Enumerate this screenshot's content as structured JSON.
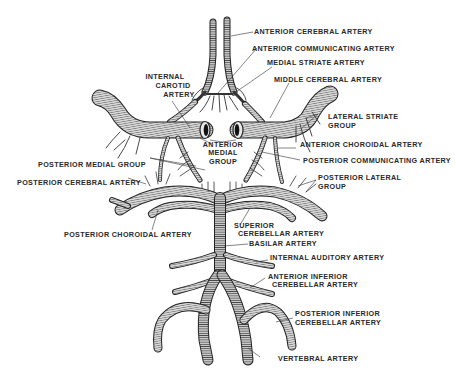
{
  "diagram": {
    "type": "anatomical-illustration",
    "colors": {
      "vessel_fill": "#d6d6d6",
      "vessel_hatch": "#4a4a4a",
      "vessel_edge": "#222222",
      "label": "#2a2a2a",
      "leader": "#333333",
      "background": "#ffffff"
    },
    "labels": {
      "anterior_cerebral_artery": "ANTERIOR CEREBRAL ARTERY",
      "anterior_communicating_artery": "ANTERIOR COMMUNICATING ARTERY",
      "medial_striate_artery": "MEDIAL STRIATE ARTERY",
      "middle_cerebral_artery": "MIDDLE CEREBRAL ARTERY",
      "internal_carotid_artery_1": "INTERNAL",
      "internal_carotid_artery_2": "CAROTID",
      "internal_carotid_artery_3": "ARTERY",
      "lateral_striate_group_1": "LATERAL STRIATE",
      "lateral_striate_group_2": "GROUP",
      "anterior_medial_group_1": "ANTERIOR",
      "anterior_medial_group_2": "MEDIAL",
      "anterior_medial_group_3": "GROUP",
      "anterior_choroidal_artery": "ANTERIOR CHOROIDAL ARTERY",
      "posterior_communicating_artery": "POSTERIOR COMMUNICATING ARTERY",
      "posterior_medial_group": "POSTERIOR MEDIAL GROUP",
      "posterior_cerebral_artery": "POSTERIOR CEREBRAL ARTERY",
      "posterior_lateral_group_1": "POSTERIOR LATERAL",
      "posterior_lateral_group_2": "GROUP",
      "posterior_choroidal_artery": "POSTERIOR CHOROIDAL ARTERY",
      "superior_cerebellar_artery_1": "SUPERIOR",
      "superior_cerebellar_artery_2": "CEREBELLAR ARTERY",
      "basilar_artery": "BASILAR ARTERY",
      "internal_auditory_artery": "INTERNAL AUDITORY ARTERY",
      "anterior_inferior_cerebellar_artery_1": "ANTERIOR INFERIOR",
      "anterior_inferior_cerebellar_artery_2": "CEREBELLAR ARTERY",
      "posterior_inferior_cerebellar_artery_1": "POSTERIOR INFERIOR",
      "posterior_inferior_cerebellar_artery_2": "CEREBELLAR ARTERY",
      "vertebral_artery": "VERTEBRAL ARTERY"
    }
  }
}
